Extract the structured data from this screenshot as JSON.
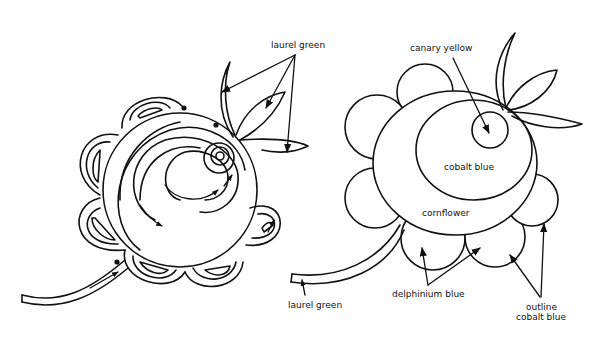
{
  "diagram": {
    "type": "illustration",
    "left_flower": {
      "labels": [
        {
          "id": "leaves",
          "text": "laurel green"
        }
      ]
    },
    "right_flower": {
      "labels": [
        {
          "id": "center",
          "text": "canary yellow"
        },
        {
          "id": "inner",
          "text": "cobalt blue"
        },
        {
          "id": "middle",
          "text": "cornflower"
        },
        {
          "id": "stem",
          "text": "laurel green"
        },
        {
          "id": "petals",
          "text": "delphinium blue"
        },
        {
          "id": "outline_line1",
          "text": "outline"
        },
        {
          "id": "outline_line2",
          "text": "cobalt blue"
        }
      ]
    },
    "colors": {
      "background": "#ffffff",
      "ink": "#111111"
    }
  }
}
